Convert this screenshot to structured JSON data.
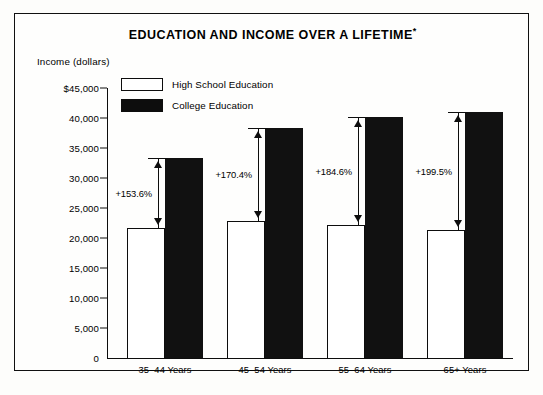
{
  "chart_data": {
    "type": "bar",
    "title": "EDUCATION AND INCOME OVER A LIFETIME*",
    "title_main": "EDUCATION AND INCOME OVER A LIFETIME",
    "title_footnote_marker": "*",
    "ylabel": "Income (dollars)",
    "xlabel": "",
    "ylim": [
      0,
      45000
    ],
    "grid": false,
    "legend_position": "top-left inside plot",
    "categories": [
      "35–44 Years",
      "45–54 Years",
      "55–64 Years",
      "65+ Years"
    ],
    "series": [
      {
        "name": "High School Education",
        "fill": "white",
        "color": "#ffffff",
        "values": [
          21700,
          22800,
          22100,
          21400
        ]
      },
      {
        "name": "College Education",
        "fill": "black",
        "color": "#111111",
        "values": [
          33400,
          38400,
          40200,
          41000
        ]
      }
    ],
    "annotations": [
      {
        "category": "35–44 Years",
        "label": "+153.6%",
        "from": 21700,
        "to": 33400
      },
      {
        "category": "45–54 Years",
        "label": "+170.4%",
        "from": 22800,
        "to": 38400
      },
      {
        "category": "55–64 Years",
        "label": "+184.6%",
        "from": 22100,
        "to": 40200
      },
      {
        "category": "65+ Years",
        "label": "+199.5%",
        "from": 21400,
        "to": 41000
      }
    ],
    "yticks": [
      {
        "value": 45000,
        "label": "$45,000"
      },
      {
        "value": 40000,
        "label": "40,000"
      },
      {
        "value": 35000,
        "label": "35,000"
      },
      {
        "value": 30000,
        "label": "30,000"
      },
      {
        "value": 25000,
        "label": "25,000"
      },
      {
        "value": 20000,
        "label": "20,000"
      },
      {
        "value": 15000,
        "label": "15,000"
      },
      {
        "value": 10000,
        "label": "10,000"
      },
      {
        "value": 5000,
        "label": "5,000"
      },
      {
        "value": 0,
        "label": "0"
      }
    ]
  },
  "colors": {
    "ink": "#0d0d0d",
    "paper": "#fefefd",
    "bar_high_school": "#ffffff",
    "bar_college": "#111111"
  }
}
